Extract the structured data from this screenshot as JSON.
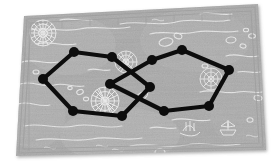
{
  "image": {
    "title": "Graph overlay on antique map",
    "width": 274,
    "height": 168,
    "background_color": "#ffffff"
  },
  "map": {
    "name": "vintage-nautical-map",
    "paper_color": "#a9a9a9",
    "paper_color_light": "#bdbdbd",
    "ink_color": "#e8e8e8",
    "border_color": "#9a9a9a",
    "rotation_degrees": -3.2,
    "corners": [
      {
        "x": 24,
        "y": 16
      },
      {
        "x": 258,
        "y": 4
      },
      {
        "x": 266,
        "y": 150
      },
      {
        "x": 16,
        "y": 156
      }
    ],
    "decorations": [
      {
        "name": "compass-rose-top-left",
        "x": 43,
        "y": 33,
        "r": 13
      },
      {
        "name": "compass-rose-center-left",
        "x": 105,
        "y": 100,
        "r": 14
      },
      {
        "name": "compass-rose-top-center",
        "x": 125,
        "y": 62,
        "r": 11
      },
      {
        "name": "compass-rose-right",
        "x": 210,
        "y": 78,
        "r": 11
      },
      {
        "name": "sea-monster-glyph",
        "x": 190,
        "y": 126,
        "r": 9
      },
      {
        "name": "ship-glyph",
        "x": 228,
        "y": 124,
        "r": 8
      }
    ]
  },
  "chart_data": {
    "type": "graph",
    "node_color": "#0d0d0d",
    "edge_color": "#0d0d0d",
    "node_radius": 5,
    "edge_width": 4.2,
    "node_count": 12,
    "edge_count": 12,
    "nodes": [
      {
        "id": "L1",
        "label": "L1",
        "x": 43,
        "y": 79
      },
      {
        "id": "L2",
        "label": "L2",
        "x": 74,
        "y": 52
      },
      {
        "id": "L3",
        "label": "L3",
        "x": 112,
        "y": 57
      },
      {
        "id": "L4",
        "label": "L4",
        "x": 152,
        "y": 60
      },
      {
        "id": "L5",
        "label": "L5",
        "x": 122,
        "y": 116
      },
      {
        "id": "L6",
        "label": "L6",
        "x": 73,
        "y": 111
      },
      {
        "id": "R1",
        "label": "R1",
        "x": 182,
        "y": 50
      },
      {
        "id": "R2",
        "label": "R2",
        "x": 229,
        "y": 70
      },
      {
        "id": "R3",
        "label": "R3",
        "x": 209,
        "y": 106
      },
      {
        "id": "R4",
        "label": "R4",
        "x": 164,
        "y": 111
      },
      {
        "id": "R5",
        "label": "R5",
        "x": 110,
        "y": 84
      },
      {
        "id": "R6",
        "label": "R6",
        "x": 150,
        "y": 87
      }
    ],
    "edges": [
      {
        "from": "L1",
        "to": "L2"
      },
      {
        "from": "L2",
        "to": "L3"
      },
      {
        "from": "L3",
        "to": "R6"
      },
      {
        "from": "R6",
        "to": "L5"
      },
      {
        "from": "L5",
        "to": "L6"
      },
      {
        "from": "L6",
        "to": "L1"
      },
      {
        "from": "L4",
        "to": "R1"
      },
      {
        "from": "R1",
        "to": "R2"
      },
      {
        "from": "R2",
        "to": "R3"
      },
      {
        "from": "R3",
        "to": "R4"
      },
      {
        "from": "R4",
        "to": "R5"
      },
      {
        "from": "R5",
        "to": "L4"
      }
    ],
    "crossing_point": {
      "x": 131,
      "y": 86
    }
  }
}
